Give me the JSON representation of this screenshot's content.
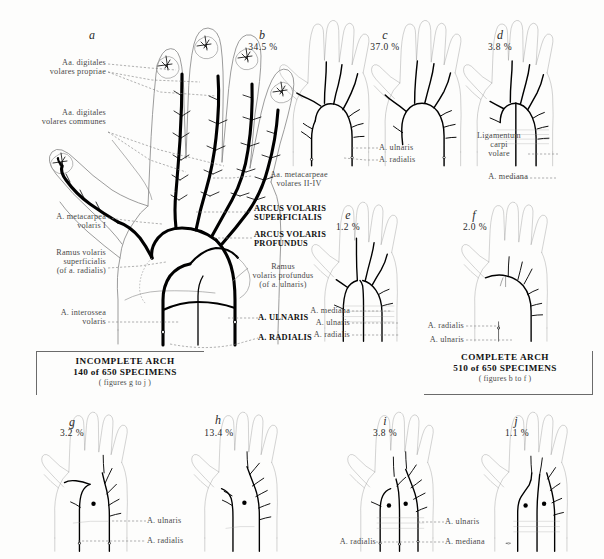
{
  "figure": {
    "specimen_total": 650
  },
  "panels": {
    "a": {
      "letter": "a",
      "percent": "",
      "labels_left": [
        {
          "line1": "Aa. digitales",
          "line2": "volares propriae"
        },
        {
          "line1": "Aa. digitales",
          "line2": "volares communes"
        },
        {
          "line1": "A. metacarpea",
          "line2": "volaris I"
        },
        {
          "line1": "Ramus volaris",
          "line2": "superficialis",
          "line3": "(of a. radialis)"
        },
        {
          "line1": "A. interossea",
          "line2": "volaris"
        }
      ],
      "labels_right": [
        {
          "line1": "Aa. metacarpeae",
          "line2": "volares II-IV",
          "bold": false
        },
        {
          "line1": "ARCUS VOLARIS",
          "line2": "SUPERFICIALIS",
          "bold": true
        },
        {
          "line1": "ARCUS VOLARIS",
          "line2": "PROFUNDUS",
          "bold": true
        },
        {
          "line1": "Ramus",
          "line2": "volaris profundus",
          "line3": "(of a. ulnaris)",
          "bold": false
        },
        {
          "line1": "A. ULNARIS",
          "bold": true
        },
        {
          "line1": "A. RADIALIS",
          "bold": true
        }
      ]
    },
    "b": {
      "letter": "b",
      "percent": "34.5 %",
      "labels": [
        "A. ulnaris",
        "A. radialis"
      ]
    },
    "c": {
      "letter": "c",
      "percent": "37.0 %",
      "labels": [
        "A. ulnaris",
        "A. radialis"
      ]
    },
    "d": {
      "letter": "d",
      "percent": "3.8 %",
      "labels": [
        "Ligamentum",
        "carpi",
        "volare",
        "A. mediana"
      ]
    },
    "e": {
      "letter": "e",
      "percent": "1.2 %",
      "labels": [
        "A. mediana",
        "A. ulnaris",
        "A. radialis"
      ]
    },
    "f": {
      "letter": "f",
      "percent": "2.0 %",
      "labels": [
        "A. radialis",
        "A. ulnaris"
      ]
    },
    "g": {
      "letter": "g",
      "percent": "3.2 %",
      "labels": [
        "A. ulnaris",
        "A. radialis"
      ]
    },
    "h": {
      "letter": "h",
      "percent": "13.4 %",
      "labels": []
    },
    "i": {
      "letter": "i",
      "percent": "3.8 %",
      "labels": [
        "A. radialis",
        "A. ulnaris",
        "A. mediana"
      ]
    },
    "j": {
      "letter": "j",
      "percent": "1.1 %",
      "labels": []
    }
  },
  "captions": {
    "incomplete": {
      "line1": "INCOMPLETE ARCH",
      "line2": "140 of 650 SPECIMENS",
      "line3": "( figures g to j )"
    },
    "complete": {
      "line1": "COMPLETE ARCH",
      "line2": "510 of 650 SPECIMENS",
      "line3": "( figures b to f )"
    }
  },
  "labels_text": {
    "a_ulnaris": "A. ulnaris",
    "a_radialis": "A. radialis",
    "a_mediana": "A. mediana"
  },
  "colors": {
    "ink": "#000000",
    "outline": "#8a8a8a",
    "label": "#4a4a4a",
    "background": "#fdfdfc"
  }
}
